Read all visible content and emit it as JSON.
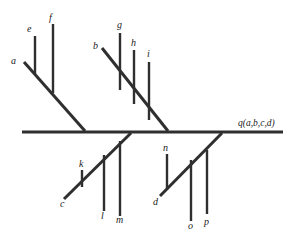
{
  "diagram": {
    "title": "q(a,b,c,d)",
    "root_label": "q(a,b,c,d)",
    "background_color": "#ffffff",
    "line_color": "#2f2f2f",
    "labels": {
      "a": "a",
      "b": "b",
      "c": "c",
      "d": "d",
      "e": "e",
      "f": "f",
      "g": "g",
      "h": "h",
      "i": "i",
      "k": "k",
      "l": "l",
      "m": "m",
      "n": "n",
      "o": "o",
      "p": "p",
      "root": "q(a,b,c,d)"
    },
    "nodes": [
      {
        "id": "a",
        "label": "a",
        "label_x": 11,
        "label_y": 64,
        "type": "branch-tip"
      },
      {
        "id": "e",
        "label": "e",
        "label_x": 27,
        "label_y": 32,
        "type": "leaf-stem"
      },
      {
        "id": "f",
        "label": "f",
        "label_x": 49,
        "label_y": 21,
        "type": "leaf-stem"
      },
      {
        "id": "b",
        "label": "b",
        "label_x": 93,
        "label_y": 49,
        "type": "branch-tip"
      },
      {
        "id": "g",
        "label": "g",
        "label_x": 117,
        "label_y": 28,
        "type": "leaf-stem"
      },
      {
        "id": "h",
        "label": "h",
        "label_x": 131,
        "label_y": 46,
        "type": "leaf-stem"
      },
      {
        "id": "i",
        "label": "i",
        "label_x": 147,
        "label_y": 56,
        "type": "leaf-stem"
      },
      {
        "id": "c",
        "label": "c",
        "label_x": 60,
        "label_y": 206,
        "type": "branch-tip"
      },
      {
        "id": "k",
        "label": "k",
        "label_x": 79,
        "label_y": 166,
        "type": "leaf-stem"
      },
      {
        "id": "l",
        "label": "l",
        "label_x": 101,
        "label_y": 218,
        "type": "leaf-stem"
      },
      {
        "id": "m",
        "label": "m",
        "label_x": 117,
        "label_y": 222,
        "type": "leaf-stem"
      },
      {
        "id": "d",
        "label": "d",
        "label_x": 154,
        "label_y": 204,
        "type": "branch-tip"
      },
      {
        "id": "n",
        "label": "n",
        "label_x": 164,
        "label_y": 150,
        "type": "leaf-stem"
      },
      {
        "id": "o",
        "label": "o",
        "label_x": 189,
        "label_y": 228,
        "type": "leaf-stem"
      },
      {
        "id": "p",
        "label": "p",
        "label_x": 205,
        "label_y": 224,
        "type": "leaf-stem"
      }
    ],
    "trunk": {
      "x1": 22,
      "y1": 132,
      "x2": 283,
      "y2": 132
    },
    "branches": [
      {
        "id": "branch-a",
        "from": "a",
        "x1": 24,
        "y1": 62,
        "x2": 85,
        "y2": 131
      },
      {
        "id": "branch-b",
        "from": "b",
        "x1": 102,
        "y1": 48,
        "x2": 168,
        "y2": 131
      },
      {
        "id": "branch-c",
        "from": "c",
        "x1": 64,
        "y1": 199,
        "x2": 131,
        "y2": 133
      },
      {
        "id": "branch-d",
        "from": "d",
        "x1": 160,
        "y1": 196,
        "x2": 222,
        "y2": 133
      }
    ],
    "stems": [
      {
        "id": "stem-e",
        "x": 35,
        "y1": 36,
        "y2": 74
      },
      {
        "id": "stem-f",
        "x": 53,
        "y1": 24,
        "y2": 93
      },
      {
        "id": "stem-g",
        "x": 120,
        "y1": 33,
        "y2": 90
      },
      {
        "id": "stem-h",
        "x": 134,
        "y1": 50,
        "y2": 104
      },
      {
        "id": "stem-i",
        "x": 149,
        "y1": 62,
        "y2": 120
      },
      {
        "id": "stem-k",
        "x": 82,
        "y1": 170,
        "y2": 187
      },
      {
        "id": "stem-l",
        "x": 104,
        "y1": 155,
        "y2": 211
      },
      {
        "id": "stem-m",
        "x": 120,
        "y1": 141,
        "y2": 216
      },
      {
        "id": "stem-n",
        "x": 167,
        "y1": 154,
        "y2": 190
      },
      {
        "id": "stem-o",
        "x": 191,
        "y1": 160,
        "y2": 221
      },
      {
        "id": "stem-p",
        "x": 207,
        "y1": 150,
        "y2": 214
      }
    ],
    "root_label_pos": {
      "x": 238,
      "y": 126
    }
  }
}
